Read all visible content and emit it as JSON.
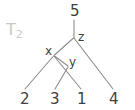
{
  "figure": {
    "tree_name": "T",
    "tree_subscript": "2",
    "root_label": "5",
    "internal_nodes": [
      {
        "id": "z",
        "label": "z"
      },
      {
        "id": "x",
        "label": "x"
      },
      {
        "id": "y",
        "label": "y"
      }
    ],
    "leaves": [
      {
        "id": "leaf-2",
        "label": "2"
      },
      {
        "id": "leaf-3",
        "label": "3"
      },
      {
        "id": "leaf-1",
        "label": "1"
      },
      {
        "id": "leaf-4",
        "label": "4"
      }
    ],
    "colors": {
      "background": "#ffffff",
      "edge": "#8d8d8d",
      "text": "#3f3f3f",
      "tree_name_text": "#c8c8c8"
    }
  }
}
